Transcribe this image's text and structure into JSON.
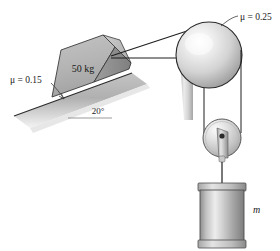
{
  "figure": {
    "background_color": "#ffffff",
    "line_color": "#1a1a1a",
    "surface_gray": "#b9b9b9",
    "block_gray": "#b5b5b5",
    "metal_light": "#f2f2f2",
    "metal_mid": "#c8c8c8",
    "metal_dark": "#8f8f8f"
  },
  "labels": {
    "incline_friction": "μ = 0.15",
    "drum_friction": "μ = 0.25",
    "block_mass": "50 kg",
    "incline_angle": "20°",
    "hanging_mass": "m"
  },
  "elements": {
    "incline": {
      "name": "inclined-surface",
      "angle_deg": 20,
      "friction_coefficient": 0.15
    },
    "block": {
      "name": "block-on-incline",
      "mass_kg": 50,
      "label": "50 kg"
    },
    "drum": {
      "name": "fixed-drum",
      "friction_coefficient": 0.25,
      "label": "μ = 0.25"
    },
    "pulley": {
      "name": "movable-pulley"
    },
    "weight": {
      "name": "hanging-cylinder-mass",
      "label": "m"
    },
    "cords": [
      {
        "name": "cord-block-to-drum-upper"
      },
      {
        "name": "cord-block-to-drum-lower"
      },
      {
        "name": "cord-drum-to-pulley-left"
      },
      {
        "name": "cord-drum-to-pulley-right"
      },
      {
        "name": "cord-pulley-to-mass"
      }
    ]
  }
}
